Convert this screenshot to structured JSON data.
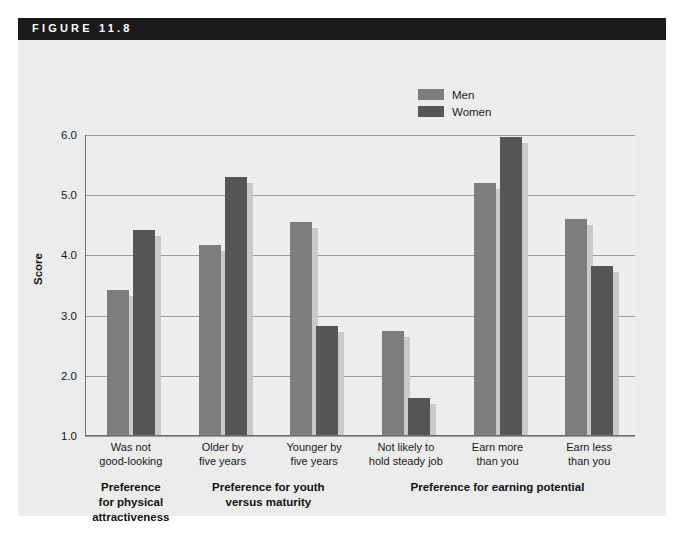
{
  "figure": {
    "header_label": "FIGURE 11.8"
  },
  "chart_data": {
    "type": "bar",
    "title": "FIGURE 11.8",
    "xlabel": "",
    "ylabel": "Score",
    "ylim": [
      1.0,
      6.0
    ],
    "ytick_labels": [
      "1.0",
      "2.0",
      "3.0",
      "4.0",
      "5.0",
      "6.0"
    ],
    "yticks": [
      1.0,
      2.0,
      3.0,
      4.0,
      5.0,
      6.0
    ],
    "grid": true,
    "legend_position": "top-center-right",
    "categories": [
      "Was not good-looking",
      "Older by five years",
      "Younger by five years",
      "Not likely to hold steady job",
      "Earn more than you",
      "Earn less than you"
    ],
    "category_lines": [
      [
        "Was not",
        "good-looking"
      ],
      [
        "Older by",
        "five years"
      ],
      [
        "Younger by",
        "five years"
      ],
      [
        "Not likely to",
        "hold steady job"
      ],
      [
        "Earn more",
        "than you"
      ],
      [
        "Earn less",
        "than you"
      ]
    ],
    "series": [
      {
        "name": "Men",
        "color": "#7d7d7d",
        "values": [
          3.42,
          4.17,
          4.55,
          2.75,
          5.2,
          4.6
        ]
      },
      {
        "name": "Women",
        "color": "#565656",
        "values": [
          4.43,
          5.3,
          2.83,
          1.63,
          5.97,
          3.82
        ]
      }
    ],
    "group_labels": [
      {
        "lines": [
          "Preference",
          "for physical",
          "attractiveness"
        ],
        "spans_categories": [
          0,
          0
        ]
      },
      {
        "lines": [
          "Preference for youth",
          "versus maturity"
        ],
        "spans_categories": [
          1,
          2
        ]
      },
      {
        "lines": [
          "Preference for earning potential"
        ],
        "spans_categories": [
          3,
          5
        ]
      }
    ]
  },
  "legend": {
    "items": [
      {
        "label": "Men",
        "color": "#7d7d7d"
      },
      {
        "label": "Women",
        "color": "#565656"
      }
    ]
  }
}
